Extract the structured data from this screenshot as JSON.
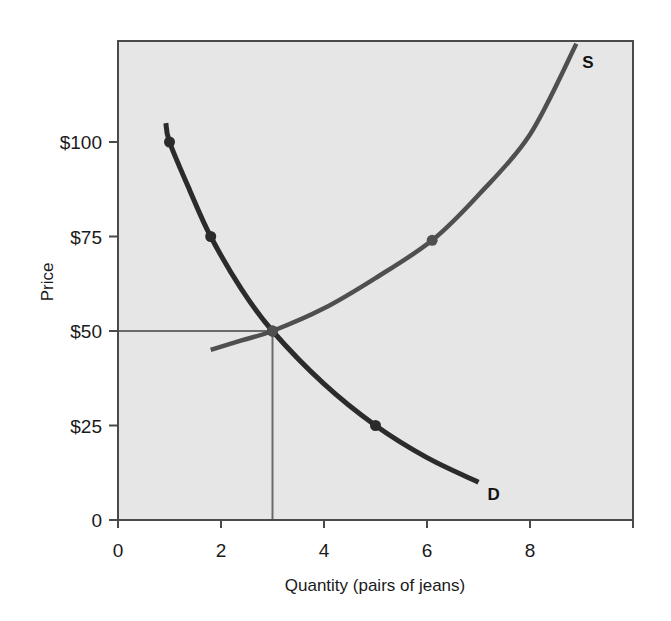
{
  "chart_data": {
    "type": "line",
    "title": "",
    "xlabel": "Quantity (pairs of jeans)",
    "ylabel": "Price",
    "xlim": [
      0,
      10
    ],
    "ylim": [
      0,
      128
    ],
    "grid": false,
    "legend": "none",
    "x_ticks": [
      0,
      2,
      4,
      6,
      8,
      10
    ],
    "x_tick_labels": [
      "0",
      "2",
      "4",
      "6",
      "8",
      ""
    ],
    "y_ticks": [
      0,
      25,
      50,
      75,
      100
    ],
    "y_tick_labels": [
      "0",
      "$25",
      "$50",
      "$75",
      "$100"
    ],
    "series": [
      {
        "name": "D",
        "label": "D",
        "description": "Demand curve",
        "curve": [
          [
            0.93,
            105
          ],
          [
            1.0,
            100
          ],
          [
            1.4,
            87
          ],
          [
            1.8,
            75
          ],
          [
            2.4,
            61
          ],
          [
            3.0,
            50
          ],
          [
            4.0,
            36
          ],
          [
            5.0,
            25
          ],
          [
            6.0,
            16.5
          ],
          [
            7.0,
            10
          ]
        ],
        "marked_points": [
          [
            1.0,
            100
          ],
          [
            1.8,
            75
          ],
          [
            3.0,
            50
          ],
          [
            5.0,
            25
          ]
        ]
      },
      {
        "name": "S",
        "label": "S",
        "description": "Supply curve",
        "curve": [
          [
            1.8,
            45
          ],
          [
            2.4,
            47.5
          ],
          [
            3.0,
            50
          ],
          [
            4.0,
            56
          ],
          [
            5.0,
            64
          ],
          [
            6.1,
            74
          ],
          [
            7.0,
            86
          ],
          [
            8.0,
            102
          ],
          [
            8.9,
            126
          ]
        ],
        "marked_points": [
          [
            3.0,
            50
          ],
          [
            6.1,
            74
          ]
        ]
      }
    ],
    "equilibrium": {
      "quantity": 3,
      "price": 50
    },
    "reference_lines": [
      {
        "orientation": "horizontal",
        "from": [
          0,
          50
        ],
        "to": [
          3,
          50
        ]
      },
      {
        "orientation": "vertical",
        "from": [
          3,
          0
        ],
        "to": [
          3,
          50
        ]
      }
    ],
    "colors": {
      "plot_background": "#e6e6e6",
      "frame": "#4a4a4a",
      "demand_line": "#2b2b2b",
      "supply_line": "#4f4f4f",
      "reference_line": "#6a6a6a",
      "text": "#1a1a1a"
    }
  },
  "layout": {
    "plot": {
      "left": 118,
      "top": 41,
      "right": 633,
      "bottom": 520
    },
    "px_per_x": 51.5,
    "px_per_y": 3.78
  }
}
